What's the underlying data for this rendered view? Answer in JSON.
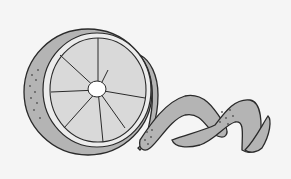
{
  "image": {
    "subject": "orange-slice-with-peel-spiral",
    "colors": {
      "background": "#f5f5f5",
      "rind": "#b4b4b4",
      "pulp": "#d9d9d9",
      "outline": "#2a2a2a",
      "center": "#ffffff",
      "dots": "#555555"
    }
  }
}
